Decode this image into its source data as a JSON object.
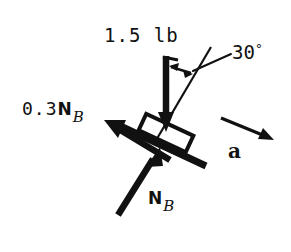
{
  "diagram": {
    "type": "free-body-diagram",
    "ink_color": "#111111",
    "background_color": "#ffffff",
    "width": 291,
    "height": 252,
    "labels": {
      "weight": "1.5 lb",
      "angle_value": "30",
      "angle_degree_symbol": "°",
      "friction_number": "0.3",
      "friction_symbol": "N",
      "friction_subscript": "B",
      "normal_symbol": "N",
      "normal_subscript": "B",
      "acceleration": "a"
    },
    "elements": [
      {
        "name": "incline-surface-bar",
        "kind": "thick-bar",
        "x1": 116,
        "y1": 124,
        "x2": 206,
        "y2": 166,
        "thickness": 7
      },
      {
        "name": "block-rectangle",
        "kind": "outlined-rectangle",
        "center_x": 166,
        "center_y": 133,
        "length": 52,
        "height": 17,
        "rotation_deg": 25,
        "stroke": 4,
        "fill": "none"
      },
      {
        "name": "weight-force-arrow",
        "kind": "arrow",
        "x1": 166,
        "y1": 56,
        "x2": 166,
        "y2": 129,
        "thickness": 6,
        "head_length": 15,
        "head_width": 15,
        "direction": "down"
      },
      {
        "name": "friction-force-arrow",
        "kind": "arrow",
        "x1": 168,
        "y1": 159,
        "x2": 107,
        "y2": 122,
        "thickness": 6,
        "head_length": 20,
        "head_width": 18,
        "direction": "up-left"
      },
      {
        "name": "normal-force-arrow",
        "kind": "arrow",
        "x1": 119,
        "y1": 214,
        "x2": 159,
        "y2": 149,
        "thickness": 6,
        "head_length": 20,
        "head_width": 17,
        "direction": "up-right"
      },
      {
        "name": "acceleration-arrow",
        "kind": "arrow",
        "x1": 221,
        "y1": 118,
        "x2": 272,
        "y2": 141,
        "thickness": 3,
        "head_length": 14,
        "head_width": 11,
        "direction": "down-right"
      },
      {
        "name": "angle-reference-line",
        "kind": "thin-line",
        "x1": 155,
        "y1": 141,
        "x2": 210,
        "y2": 48,
        "thickness": 2
      },
      {
        "name": "angle-double-arrow",
        "kind": "double-arrow",
        "x1": 170,
        "y1": 67,
        "x2": 192,
        "y2": 74,
        "thickness": 2
      },
      {
        "name": "angle-leader-line",
        "kind": "thin-line",
        "x1": 196,
        "y1": 70,
        "x2": 231,
        "y2": 53,
        "thickness": 2
      }
    ]
  }
}
